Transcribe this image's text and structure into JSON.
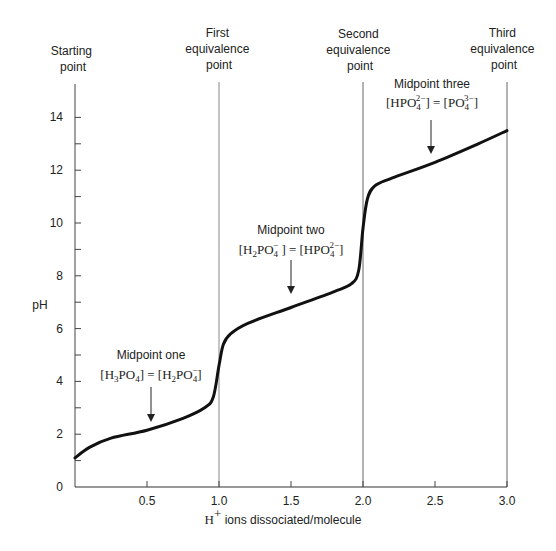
{
  "chart_data": {
    "type": "line",
    "title": "",
    "xlabel_prefix": "H",
    "xlabel_sup": "+",
    "xlabel_rest": " ions dissociated/molecule",
    "ylabel": "pH",
    "xlim": [
      0,
      3.0
    ],
    "ylim": [
      0,
      14
    ],
    "grid": false,
    "x_ticks": [
      "0.5",
      "1.0",
      "1.5",
      "2.0",
      "2.5",
      "3.0"
    ],
    "y_ticks": [
      "0",
      "2",
      "4",
      "6",
      "8",
      "10",
      "12",
      "14"
    ],
    "series": [
      {
        "name": "Phosphoric acid titration curve",
        "x": [
          0,
          0.1,
          0.25,
          0.5,
          0.75,
          0.9,
          0.96,
          1.0,
          1.03,
          1.08,
          1.2,
          1.5,
          1.8,
          1.92,
          1.97,
          2.0,
          2.03,
          2.08,
          2.2,
          2.5,
          2.8,
          3.0
        ],
        "y": [
          1.1,
          1.5,
          1.85,
          2.15,
          2.6,
          3.0,
          3.4,
          4.6,
          5.4,
          5.8,
          6.2,
          6.8,
          7.4,
          7.7,
          8.2,
          9.8,
          10.9,
          11.4,
          11.7,
          12.3,
          13.0,
          13.5
        ]
      }
    ],
    "vertical_lines": [
      {
        "x": 0,
        "label_lines": [
          "Starting",
          "point"
        ]
      },
      {
        "x": 1.0,
        "label_lines": [
          "First",
          "equivalence",
          "point"
        ]
      },
      {
        "x": 2.0,
        "label_lines": [
          "Second",
          "equivalence",
          "point"
        ]
      },
      {
        "x": 3.0,
        "label_lines": [
          "Third",
          "equivalence",
          "point"
        ]
      }
    ],
    "annotations": [
      {
        "title": "Midpoint one",
        "equation": "[H3PO4] = [H2PO4−]",
        "x": 0.5,
        "y": 2.15
      },
      {
        "title": "Midpoint two",
        "equation": "[H2PO4−] = [HPO4 2−]",
        "x": 1.5,
        "y": 6.8
      },
      {
        "title": "Midpoint three",
        "equation": "[HPO4 2−] = [PO4 3−]",
        "x": 2.5,
        "y": 12.3
      }
    ]
  },
  "labels": {
    "starting": [
      "Starting",
      "point"
    ],
    "first": [
      "First",
      "equivalence",
      "point"
    ],
    "second": [
      "Second",
      "equivalence",
      "point"
    ],
    "third": [
      "Third",
      "equivalence",
      "point"
    ],
    "mid1_title": "Midpoint one",
    "mid2_title": "Midpoint two",
    "mid3_title": "Midpoint three"
  }
}
